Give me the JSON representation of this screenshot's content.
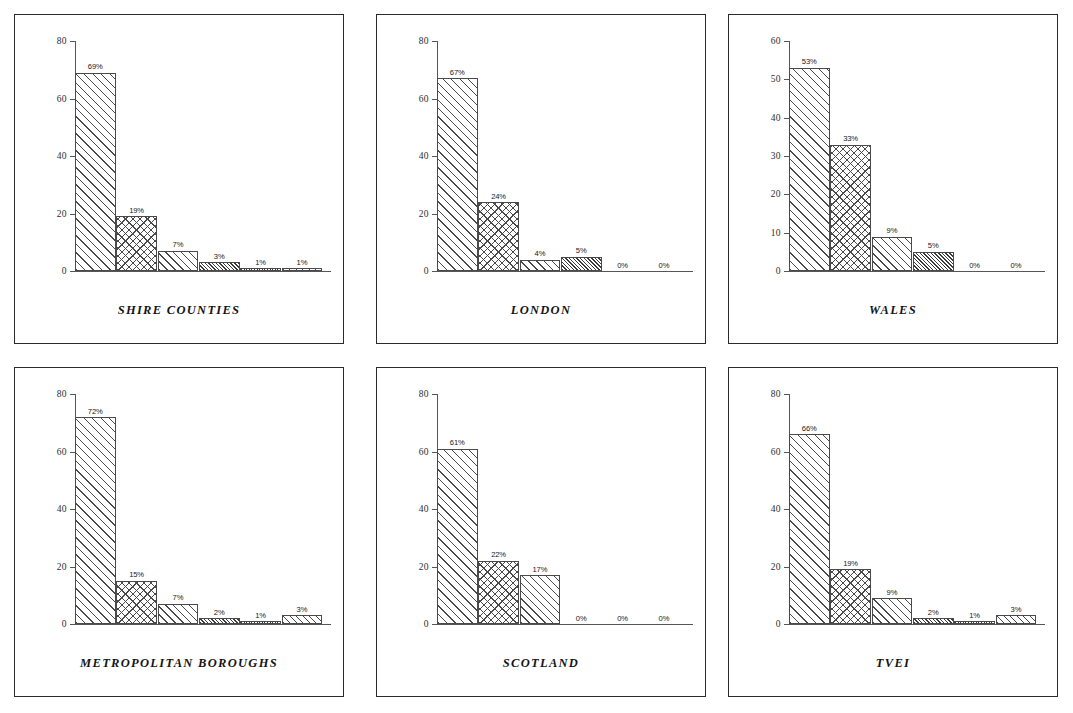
{
  "figure": {
    "background_color": "#ffffff",
    "panel_border_color": "#2b2b2b",
    "axis_color": "#55555a",
    "bar_edge_color": "#4a4a4a"
  },
  "chart_data": [
    {
      "type": "bar",
      "title": "SHIRE COUNTIES",
      "categories": [
        "1",
        "2",
        "3",
        "4",
        "5",
        "6"
      ],
      "values": [
        69,
        19,
        7,
        3,
        1,
        1
      ],
      "data_labels": [
        "69%",
        "19%",
        "7%",
        "3%",
        "1%",
        "1%"
      ],
      "patterns": [
        "diag",
        "cross",
        "diag2",
        "dense",
        "dot",
        "diag3"
      ],
      "xlabel": "",
      "ylabel": "",
      "ylim": [
        0,
        80
      ],
      "yticks": [
        0,
        20,
        40,
        60,
        80
      ],
      "ytick_labels": [
        "0",
        "20",
        "40",
        "60",
        "80"
      ],
      "grid": false,
      "legend": "none"
    },
    {
      "type": "bar",
      "title": "LONDON",
      "categories": [
        "1",
        "2",
        "3",
        "4",
        "5",
        "6"
      ],
      "values": [
        67,
        24,
        4,
        5,
        0,
        0
      ],
      "data_labels": [
        "67%",
        "24%",
        "4%",
        "5%",
        "0%",
        "0%"
      ],
      "patterns": [
        "diag",
        "cross",
        "diag2",
        "dense",
        "dot",
        "diag3"
      ],
      "xlabel": "",
      "ylabel": "",
      "ylim": [
        0,
        80
      ],
      "yticks": [
        0,
        20,
        40,
        60,
        80
      ],
      "ytick_labels": [
        "0",
        "20",
        "40",
        "60",
        "80"
      ],
      "grid": false,
      "legend": "none"
    },
    {
      "type": "bar",
      "title": "WALES",
      "categories": [
        "1",
        "2",
        "3",
        "4",
        "5",
        "6"
      ],
      "values": [
        53,
        33,
        9,
        5,
        0,
        0
      ],
      "data_labels": [
        "53%",
        "33%",
        "9%",
        "5%",
        "0%",
        "0%"
      ],
      "patterns": [
        "diag",
        "cross",
        "diag2",
        "dense",
        "dot",
        "diag3"
      ],
      "xlabel": "",
      "ylabel": "",
      "ylim": [
        0,
        60
      ],
      "yticks": [
        0,
        10,
        20,
        30,
        40,
        50,
        60
      ],
      "ytick_labels": [
        "0",
        "10",
        "20",
        "30",
        "40",
        "50",
        "60"
      ],
      "grid": false,
      "legend": "none"
    },
    {
      "type": "bar",
      "title": "METROPOLITAN BOROUGHS",
      "categories": [
        "1",
        "2",
        "3",
        "4",
        "5",
        "6"
      ],
      "values": [
        72,
        15,
        7,
        2,
        1,
        3
      ],
      "data_labels": [
        "72%",
        "15%",
        "7%",
        "2%",
        "1%",
        "3%"
      ],
      "patterns": [
        "diag",
        "cross",
        "diag2",
        "dense",
        "dot",
        "diag3"
      ],
      "xlabel": "",
      "ylabel": "",
      "ylim": [
        0,
        80
      ],
      "yticks": [
        0,
        20,
        40,
        60,
        80
      ],
      "ytick_labels": [
        "0",
        "20",
        "40",
        "60",
        "80"
      ],
      "grid": false,
      "legend": "none"
    },
    {
      "type": "bar",
      "title": "SCOTLAND",
      "categories": [
        "1",
        "2",
        "3",
        "4",
        "5",
        "6"
      ],
      "values": [
        61,
        22,
        17,
        0,
        0,
        0
      ],
      "data_labels": [
        "61%",
        "22%",
        "17%",
        "0%",
        "0%",
        "0%"
      ],
      "patterns": [
        "diag",
        "cross",
        "diag2",
        "dense",
        "dot",
        "diag3"
      ],
      "xlabel": "",
      "ylabel": "",
      "ylim": [
        0,
        80
      ],
      "yticks": [
        0,
        20,
        40,
        60,
        80
      ],
      "ytick_labels": [
        "0",
        "20",
        "40",
        "60",
        "80"
      ],
      "grid": false,
      "legend": "none"
    },
    {
      "type": "bar",
      "title": "TVEI",
      "categories": [
        "1",
        "2",
        "3",
        "4",
        "5",
        "6"
      ],
      "values": [
        66,
        19,
        9,
        2,
        1,
        3
      ],
      "data_labels": [
        "66%",
        "19%",
        "9%",
        "2%",
        "1%",
        "3%"
      ],
      "patterns": [
        "diag",
        "cross",
        "diag2",
        "dense",
        "dot",
        "diag3"
      ],
      "xlabel": "",
      "ylabel": "",
      "ylim": [
        0,
        80
      ],
      "yticks": [
        0,
        20,
        40,
        60,
        80
      ],
      "ytick_labels": [
        "0",
        "20",
        "40",
        "60",
        "80"
      ],
      "grid": false,
      "legend": "none"
    }
  ]
}
